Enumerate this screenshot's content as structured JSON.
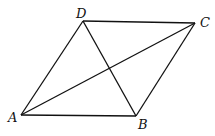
{
  "diagram": {
    "type": "rhombus-with-diagonals",
    "vertices": [
      {
        "name": "A",
        "x": 21,
        "y": 115
      },
      {
        "name": "B",
        "x": 136,
        "y": 116
      },
      {
        "name": "C",
        "x": 195,
        "y": 23
      },
      {
        "name": "D",
        "x": 83,
        "y": 21
      }
    ],
    "labels": {
      "A": "A",
      "B": "B",
      "C": "C",
      "D": "D"
    },
    "edges": [
      "AB",
      "BC",
      "CD",
      "DA"
    ],
    "diagonals": [
      "AC",
      "BD"
    ]
  }
}
